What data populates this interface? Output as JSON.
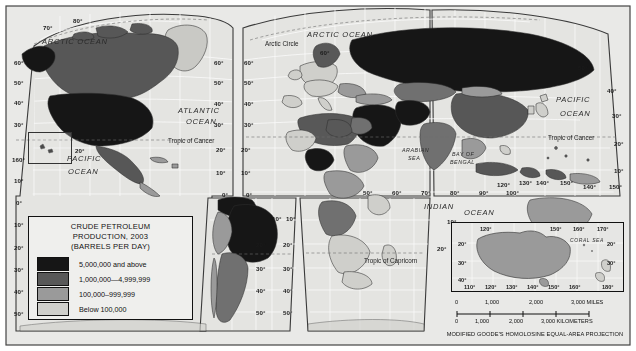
{
  "map": {
    "title": "Crude Petroleum Production, 2003",
    "projection_note": "MODIFIED GOODE'S HOMOLOSINE EQUAL-AREA PROJECTION"
  },
  "legend": {
    "title_line1": "CRUDE PETROLEUM",
    "title_line2": "PRODUCTION, 2003",
    "title_line3": "(BARRELS PER DAY)",
    "items": [
      {
        "label": "5,000,000 and above",
        "color": "#161616"
      },
      {
        "label": "1,000,000—4,999,999",
        "color": "#585858"
      },
      {
        "label": "100,000–999,999",
        "color": "#9a9a9a"
      },
      {
        "label": "Below 100,000",
        "color": "#cfcfcb"
      }
    ]
  },
  "ocean_labels": [
    {
      "name": "arctic-ocean-left",
      "text": "ARCTIC OCEAN",
      "x": 42,
      "y": 38
    },
    {
      "name": "arctic-ocean-center",
      "text": "ARCTIC OCEAN",
      "x": 307,
      "y": 31
    },
    {
      "name": "atlantic-ocean",
      "text": "ATLANTIC",
      "x": 178,
      "y": 107
    },
    {
      "name": "atlantic-ocean-2",
      "text": "OCEAN",
      "x": 186,
      "y": 118
    },
    {
      "name": "pacific-ocean-left",
      "text": "PACIFIC",
      "x": 67,
      "y": 155
    },
    {
      "name": "pacific-ocean-left-2",
      "text": "OCEAN",
      "x": 68,
      "y": 168
    },
    {
      "name": "pacific-ocean-right",
      "text": "PACIFIC",
      "x": 556,
      "y": 96
    },
    {
      "name": "pacific-ocean-right-2",
      "text": "OCEAN",
      "x": 560,
      "y": 110
    },
    {
      "name": "indian-ocean",
      "text": "INDIAN",
      "x": 424,
      "y": 203
    },
    {
      "name": "indian-ocean-2",
      "text": "OCEAN",
      "x": 464,
      "y": 209
    }
  ],
  "sea_labels": [
    {
      "name": "arabian-sea",
      "text": "ARABIAN",
      "x": 402,
      "y": 148
    },
    {
      "name": "arabian-sea-2",
      "text": "SEA",
      "x": 408,
      "y": 156
    },
    {
      "name": "bay-of-bengal",
      "text": "BAY OF",
      "x": 452,
      "y": 152
    },
    {
      "name": "bay-of-bengal-2",
      "text": "BENGAL",
      "x": 450,
      "y": 160
    }
  ],
  "reference_lines": [
    {
      "name": "arctic-circle",
      "text": "Arctic Circle",
      "x": 265,
      "y": 41
    },
    {
      "name": "tropic-of-cancer-left",
      "text": "Tropic of Cancer",
      "x": 168,
      "y": 138
    },
    {
      "name": "tropic-of-cancer-right",
      "text": "Tropic of Cancer",
      "x": 548,
      "y": 135
    },
    {
      "name": "tropic-of-capricorn",
      "text": "Tropic of Capricorn",
      "x": 364,
      "y": 258
    }
  ],
  "graticule_labels": [
    {
      "text": "70°",
      "x": 43,
      "y": 25
    },
    {
      "text": "80°",
      "x": 73,
      "y": 18
    },
    {
      "text": "60°",
      "x": 14,
      "y": 60
    },
    {
      "text": "50°",
      "x": 14,
      "y": 80
    },
    {
      "text": "40°",
      "x": 14,
      "y": 100
    },
    {
      "text": "30°",
      "x": 14,
      "y": 122
    },
    {
      "text": "20°",
      "x": 75,
      "y": 148
    },
    {
      "text": "160°",
      "x": 12,
      "y": 157
    },
    {
      "text": "10°",
      "x": 14,
      "y": 178
    },
    {
      "text": "0°",
      "x": 16,
      "y": 200
    },
    {
      "text": "10°",
      "x": 14,
      "y": 222
    },
    {
      "text": "20°",
      "x": 14,
      "y": 245
    },
    {
      "text": "30°",
      "x": 14,
      "y": 267
    },
    {
      "text": "40°",
      "x": 14,
      "y": 289
    },
    {
      "text": "50°",
      "x": 14,
      "y": 311
    },
    {
      "text": "60°",
      "x": 214,
      "y": 60
    },
    {
      "text": "50°",
      "x": 214,
      "y": 80
    },
    {
      "text": "40°",
      "x": 214,
      "y": 101
    },
    {
      "text": "30°",
      "x": 214,
      "y": 122
    },
    {
      "text": "20°",
      "x": 216,
      "y": 147
    },
    {
      "text": "10°",
      "x": 216,
      "y": 170
    },
    {
      "text": "0°",
      "x": 222,
      "y": 192
    },
    {
      "text": "10°",
      "x": 272,
      "y": 216
    },
    {
      "text": "20°",
      "x": 256,
      "y": 242
    },
    {
      "text": "30°",
      "x": 256,
      "y": 266
    },
    {
      "text": "40°",
      "x": 256,
      "y": 288
    },
    {
      "text": "50°",
      "x": 256,
      "y": 310
    },
    {
      "text": "60°",
      "x": 244,
      "y": 60
    },
    {
      "text": "50°",
      "x": 244,
      "y": 80
    },
    {
      "text": "40°",
      "x": 244,
      "y": 101
    },
    {
      "text": "30°",
      "x": 244,
      "y": 122
    },
    {
      "text": "20°",
      "x": 241,
      "y": 147
    },
    {
      "text": "10°",
      "x": 241,
      "y": 170
    },
    {
      "text": "0°",
      "x": 246,
      "y": 192
    },
    {
      "text": "10°",
      "x": 286,
      "y": 216
    },
    {
      "text": "20°",
      "x": 283,
      "y": 242
    },
    {
      "text": "30°",
      "x": 283,
      "y": 266
    },
    {
      "text": "40°",
      "x": 283,
      "y": 288
    },
    {
      "text": "50°",
      "x": 283,
      "y": 310
    },
    {
      "text": "50°",
      "x": 363,
      "y": 190
    },
    {
      "text": "60°",
      "x": 392,
      "y": 190
    },
    {
      "text": "70°",
      "x": 421,
      "y": 190
    },
    {
      "text": "80°",
      "x": 450,
      "y": 190
    },
    {
      "text": "90°",
      "x": 479,
      "y": 190
    },
    {
      "text": "100°",
      "x": 506,
      "y": 190
    },
    {
      "text": "120°",
      "x": 497,
      "y": 182
    },
    {
      "text": "130°",
      "x": 519,
      "y": 180
    },
    {
      "text": "140°",
      "x": 536,
      "y": 180
    },
    {
      "text": "150°",
      "x": 560,
      "y": 180
    },
    {
      "text": "50°",
      "x": 578,
      "y": 65
    },
    {
      "text": "40°",
      "x": 607,
      "y": 88
    },
    {
      "text": "30°",
      "x": 612,
      "y": 113
    },
    {
      "text": "20°",
      "x": 614,
      "y": 141
    },
    {
      "text": "10°",
      "x": 614,
      "y": 168
    },
    {
      "text": "140°",
      "x": 583,
      "y": 184
    },
    {
      "text": "150°",
      "x": 609,
      "y": 184
    },
    {
      "text": "60°",
      "x": 320,
      "y": 50
    },
    {
      "text": "10°",
      "x": 447,
      "y": 219
    },
    {
      "text": "20°",
      "x": 437,
      "y": 246
    }
  ],
  "inset": {
    "sea_label": "CORAL  SEA",
    "top_labels": [
      {
        "text": "120°",
        "x": 28,
        "y": 3
      },
      {
        "text": "150°",
        "x": 98,
        "y": 3
      },
      {
        "text": "160°",
        "x": 121,
        "y": 3
      },
      {
        "text": "170°",
        "x": 145,
        "y": 3
      }
    ],
    "side_labels": [
      {
        "text": "20°",
        "x": 6,
        "y": 18
      },
      {
        "text": "30°",
        "x": 6,
        "y": 37
      },
      {
        "text": "40°",
        "x": 6,
        "y": 54
      },
      {
        "text": "20°",
        "x": 155,
        "y": 18
      },
      {
        "text": "30°",
        "x": 155,
        "y": 37
      }
    ],
    "bottom_labels": [
      {
        "text": "110°",
        "x": 12,
        "y": 61
      },
      {
        "text": "120°",
        "x": 33,
        "y": 61
      },
      {
        "text": "130°",
        "x": 54,
        "y": 61
      },
      {
        "text": "140°",
        "x": 75,
        "y": 61
      },
      {
        "text": "150°",
        "x": 96,
        "y": 61
      },
      {
        "text": "160°",
        "x": 117,
        "y": 61
      },
      {
        "text": "180°",
        "x": 150,
        "y": 61
      }
    ]
  },
  "scale": {
    "miles": [
      {
        "text": "0",
        "x": 6
      },
      {
        "text": "1,000",
        "x": 36
      },
      {
        "text": "2,000",
        "x": 80
      },
      {
        "text": "3,000 MILES",
        "x": 122
      }
    ],
    "kilometers": [
      {
        "text": "0",
        "x": 6
      },
      {
        "text": "1,000",
        "x": 26
      },
      {
        "text": "2,000",
        "x": 60
      },
      {
        "text": "3,000 KILOMETERS",
        "x": 92
      }
    ]
  }
}
